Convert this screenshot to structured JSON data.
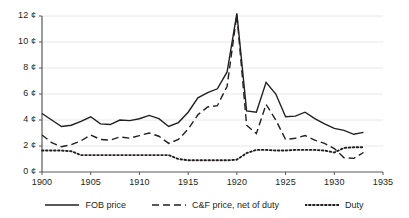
{
  "chart_data": {
    "type": "line",
    "title": "",
    "xlabel": "",
    "ylabel": "",
    "xlim": [
      1900,
      1935
    ],
    "ylim": [
      0,
      12
    ],
    "grid": true,
    "legend_position": "bottom",
    "y_unit": "¢",
    "x_ticks": [
      1900,
      1905,
      1910,
      1915,
      1920,
      1925,
      1930,
      1935
    ],
    "x_tick_labels": [
      "1900",
      "1905",
      "1910",
      "1915",
      "1920",
      "1925",
      "1930",
      "1935"
    ],
    "y_ticks": [
      0,
      2,
      4,
      6,
      8,
      10,
      12
    ],
    "y_tick_labels": [
      "0 ¢",
      "2 ¢",
      "4 ¢",
      "6 ¢",
      "8 ¢",
      "10 ¢",
      "12 ¢"
    ],
    "x": [
      1900,
      1901,
      1902,
      1903,
      1904,
      1905,
      1906,
      1907,
      1908,
      1909,
      1910,
      1911,
      1912,
      1913,
      1914,
      1915,
      1916,
      1917,
      1918,
      1919,
      1920,
      1921,
      1922,
      1923,
      1924,
      1925,
      1926,
      1927,
      1928,
      1929,
      1930,
      1931,
      1932,
      1933
    ],
    "series": [
      {
        "name": "FOB price",
        "style": "solid",
        "color": "#231f20",
        "values": [
          4.5,
          4.0,
          3.5,
          3.6,
          3.9,
          4.25,
          3.7,
          3.65,
          4.0,
          3.95,
          4.1,
          4.35,
          4.1,
          3.5,
          3.8,
          4.6,
          5.7,
          6.1,
          6.4,
          7.7,
          12.2,
          4.7,
          4.6,
          6.9,
          6.0,
          4.25,
          4.3,
          4.6,
          4.1,
          3.7,
          3.35,
          3.2,
          2.9,
          3.05
        ]
      },
      {
        "name": "C&F price, net of duty",
        "style": "dashed",
        "color": "#231f20",
        "values": [
          2.85,
          2.25,
          1.95,
          2.1,
          2.4,
          2.85,
          2.5,
          2.45,
          2.7,
          2.6,
          2.8,
          3.0,
          2.75,
          2.2,
          2.5,
          3.3,
          4.4,
          5.0,
          5.1,
          6.6,
          12.1,
          3.6,
          2.95,
          5.2,
          4.0,
          2.5,
          2.6,
          2.8,
          2.45,
          2.2,
          1.8,
          1.1,
          1.05,
          1.5
        ]
      },
      {
        "name": "Duty",
        "style": "dotted",
        "color": "#231f20",
        "values": [
          1.65,
          1.65,
          1.65,
          1.6,
          1.3,
          1.3,
          1.3,
          1.3,
          1.3,
          1.3,
          1.3,
          1.3,
          1.3,
          1.3,
          1.0,
          0.9,
          0.9,
          0.9,
          0.9,
          0.9,
          0.95,
          1.45,
          1.7,
          1.7,
          1.65,
          1.65,
          1.7,
          1.7,
          1.7,
          1.65,
          1.5,
          1.85,
          1.9,
          1.9
        ]
      }
    ],
    "legend": [
      {
        "label": "FOB price",
        "style": "solid"
      },
      {
        "label": "C&F price, net of duty",
        "style": "dashed"
      },
      {
        "label": "Duty",
        "style": "dotted"
      }
    ]
  },
  "axis_colors": {
    "axis_line": "#58595b",
    "gridline": "#e8e8e8",
    "text": "#231f20"
  }
}
